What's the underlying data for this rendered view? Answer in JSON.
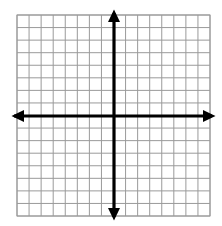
{
  "figure": {
    "background_color": "#ffffff",
    "width": 222,
    "height": 226
  },
  "chart_data": {
    "type": "scatter",
    "title": "",
    "subtitle": "",
    "xlabel": "",
    "ylabel": "",
    "xlim": [
      -8,
      8
    ],
    "ylim": [
      -8,
      8
    ],
    "x": [],
    "y": [],
    "series": [],
    "annotations": [],
    "grid": true,
    "grid_color": "#9a9a9a",
    "grid_line_width": 1,
    "grid_columns": 16,
    "grid_rows": 16,
    "grid_cell_size_px": 12.06,
    "xticks": [],
    "yticks": [],
    "xtick_labels": [],
    "ytick_labels": [],
    "legend": false,
    "legend_position": "none",
    "axes": {
      "color": "#000000",
      "line_width": 3,
      "origin_px": [
        114,
        116
      ],
      "x_axis_from_px": [
        11,
        116
      ],
      "x_axis_to_px": [
        215,
        116
      ],
      "y_axis_from_px": [
        114,
        10
      ],
      "y_axis_to_px": [
        114,
        220
      ],
      "arrowheads": [
        "left",
        "right",
        "up",
        "down"
      ]
    },
    "plot_area_px": {
      "left": 17,
      "top": 15,
      "right": 210,
      "bottom": 216
    }
  },
  "labels": {
    "x_axis_name": "x-axis",
    "y_axis_name": "y-axis",
    "origin_name": "origin"
  }
}
